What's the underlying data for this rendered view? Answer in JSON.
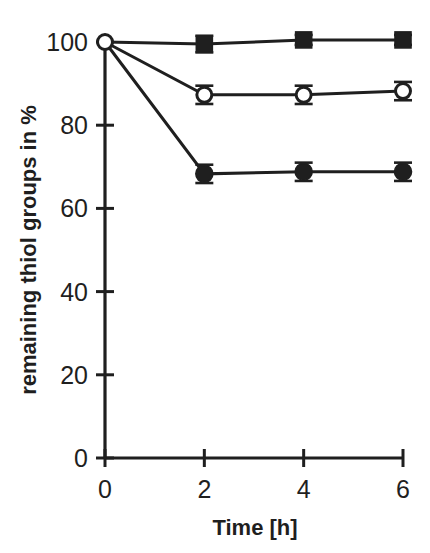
{
  "chart_data": {
    "type": "line",
    "title": "",
    "subtitle": "",
    "xlabel": "Time [h]",
    "ylabel": "remaining thiol groups in %",
    "x": [
      0,
      2,
      4,
      6
    ],
    "xlim": [
      0,
      6
    ],
    "ylim": [
      0,
      103
    ],
    "xticks": [
      0,
      2,
      4,
      6
    ],
    "xtick_labels": [
      "0",
      "2",
      "4",
      "6"
    ],
    "yticks": [
      0,
      20,
      40,
      60,
      80,
      100
    ],
    "ytick_labels": [
      "0",
      "20",
      "40",
      "60",
      "80",
      "100"
    ],
    "grid": false,
    "legend": "none",
    "series": [
      {
        "name": "filled-square-series",
        "marker": "filled-square",
        "values": [
          100.0,
          99.5,
          100.5,
          100.5
        ],
        "errors": [
          0.0,
          2.0,
          1.2,
          1.2
        ]
      },
      {
        "name": "open-circle-series",
        "marker": "open-circle",
        "values": [
          100.0,
          87.3,
          87.3,
          88.2
        ],
        "errors": [
          0.0,
          2.2,
          2.2,
          2.2
        ]
      },
      {
        "name": "filled-circle-series",
        "marker": "filled-circle",
        "values": [
          100.0,
          68.3,
          68.8,
          68.8
        ],
        "errors": [
          0.0,
          2.2,
          2.2,
          2.2
        ]
      }
    ],
    "origin_marker": "open-circle",
    "colors": {
      "ink": "#1f1f1f",
      "background": "#ffffff",
      "marker_fill": "#1f1f1f",
      "marker_open_fill": "#ffffff"
    }
  }
}
